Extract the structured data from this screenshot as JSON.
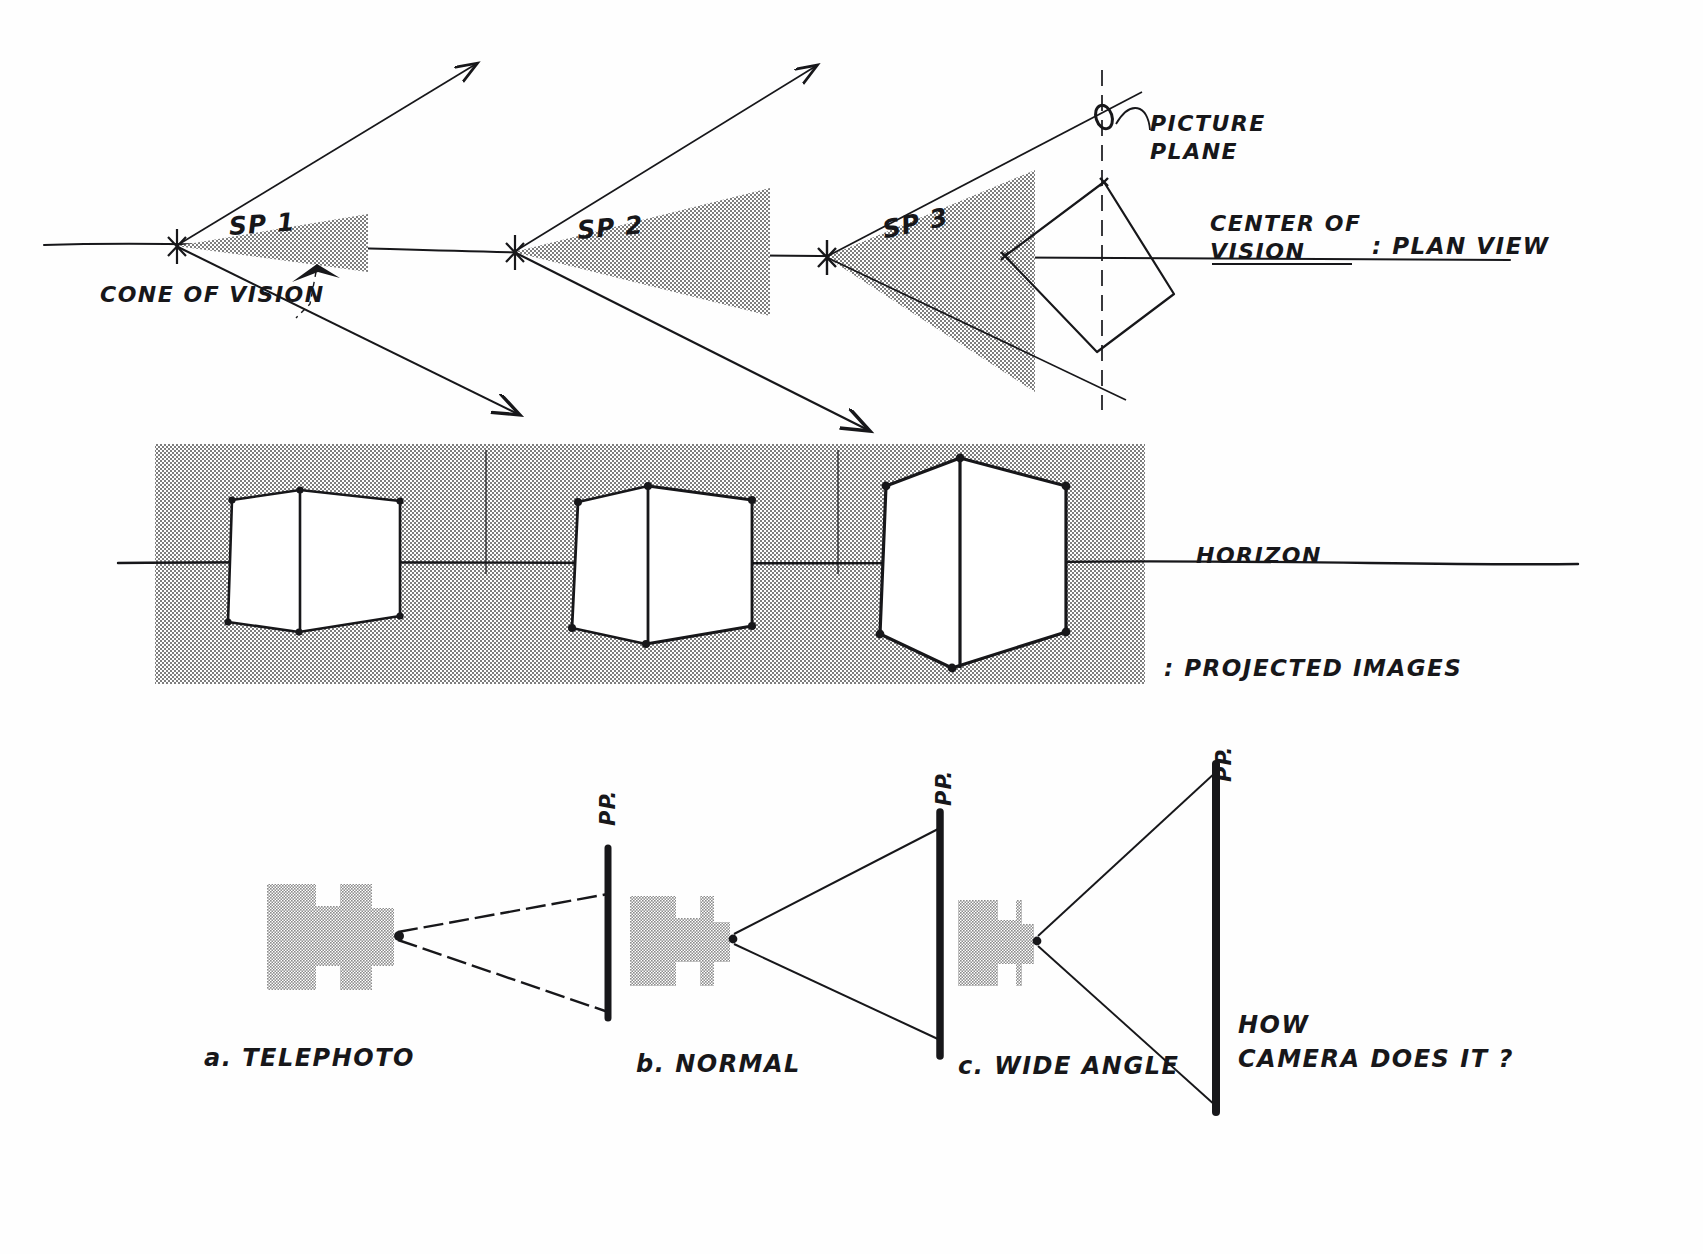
{
  "document": {
    "title": "Perspective construction: cone of vision, station points and camera lens analogy",
    "ink_color": "#17171a",
    "tone_fill": "#a8a8a8",
    "paper_color": "#fefefe"
  },
  "plan_view": {
    "section_label": ": PLAN VIEW",
    "station_points": [
      {
        "id": "sp1",
        "label": "SP 1"
      },
      {
        "id": "sp2",
        "label": "SP 2"
      },
      {
        "id": "sp3",
        "label": "SP 3"
      }
    ],
    "cone_of_vision_label": "CONE OF VISION",
    "picture_plane_label": "PICTURE\nPLANE",
    "picture_plane_label_line1": "PICTURE",
    "picture_plane_label_line2": "PLANE",
    "center_of_vision_label_line1": "CENTER OF",
    "center_of_vision_label_line2": "VISION",
    "ground_line_note": "horizontal sight line through all three station points"
  },
  "projected_images": {
    "section_label": ": PROJECTED IMAGES",
    "horizon_label": "HORIZON",
    "cubes": [
      {
        "id": "cube-1",
        "corresponds_to": "SP 1",
        "relative_size": "small"
      },
      {
        "id": "cube-2",
        "corresponds_to": "SP 2",
        "relative_size": "medium"
      },
      {
        "id": "cube-3",
        "corresponds_to": "SP 3",
        "relative_size": "large"
      }
    ]
  },
  "camera_row": {
    "question_line1": "HOW",
    "question_line2": "CAMERA DOES IT  ?",
    "picture_plane_tag": "PP.",
    "lenses": [
      {
        "id": "a",
        "label": "a.   TELEPHOTO"
      },
      {
        "id": "b",
        "label": "b.  NORMAL"
      },
      {
        "id": "c",
        "label": "c. WIDE ANGLE"
      }
    ]
  }
}
